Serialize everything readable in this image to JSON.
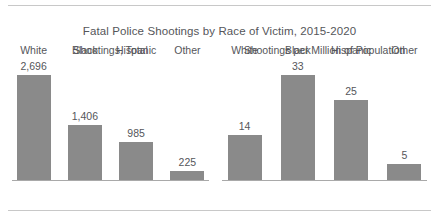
{
  "chart_data": {
    "type": "bar",
    "title": "Fatal Police Shootings by Race of Victim, 2015-2020",
    "categories": [
      "White",
      "Black",
      "Hispanic",
      "Other"
    ],
    "panels": [
      {
        "title": "Shootings, Total",
        "ylabel": "",
        "xlabel": "",
        "values": [
          2696,
          1406,
          985,
          225
        ],
        "value_labels": [
          "2,696",
          "1,406",
          "985",
          "225"
        ],
        "ylim": [
          0,
          2900
        ]
      },
      {
        "title": "Shootings per Million of Population",
        "ylabel": "",
        "xlabel": "",
        "values": [
          14,
          33,
          25,
          5
        ],
        "value_labels": [
          "14",
          "33",
          "25",
          "5"
        ],
        "ylim": [
          0,
          35.5
        ]
      }
    ],
    "grid": false,
    "legend": null,
    "bar_color": "#8a8a8a",
    "text_color": "#55565a",
    "rule_color": "#c8c8c8",
    "axis_color": "#a9a9a9"
  }
}
